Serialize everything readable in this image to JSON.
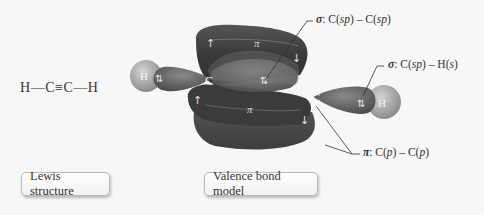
{
  "lewis_structure": {
    "formula_parts": [
      "H",
      "—",
      "C",
      "≡",
      "C",
      "—",
      "H"
    ]
  },
  "orbital_model": {
    "atoms": [
      {
        "symbol": "H",
        "position": "left"
      },
      {
        "symbol": "C",
        "position": "left-carbon"
      },
      {
        "symbol": "C",
        "position": "right-carbon"
      },
      {
        "symbol": "H",
        "position": "right"
      }
    ],
    "pi_labels": [
      "π",
      "π"
    ],
    "electron_pair_symbol": "⇅",
    "up_arrow": "↑",
    "down_arrow": "↓",
    "colors": {
      "pi_lobe": "#3f3f3f",
      "sigma_lobe": "#6a6a6a",
      "h_sphere": "#a8a8a8",
      "background": "#f7f7f7"
    }
  },
  "callouts": {
    "sigma_cc": {
      "symbol": "σ",
      "text_prefix": ": C(",
      "sp1": "sp",
      "mid": ") – C(",
      "sp2": "sp",
      "suffix": ")"
    },
    "sigma_ch": {
      "symbol": "σ",
      "text_prefix": ": C(",
      "sp1": "sp",
      "mid": ") – H(",
      "sp2": "s",
      "suffix": ")"
    },
    "pi_cc": {
      "symbol": "π",
      "text_prefix": ": C(",
      "sp1": "p",
      "mid": ") – C(",
      "sp2": "p",
      "suffix": ")"
    }
  },
  "buttons": {
    "lewis": "Lewis structure",
    "valence": "Valence bond model"
  }
}
